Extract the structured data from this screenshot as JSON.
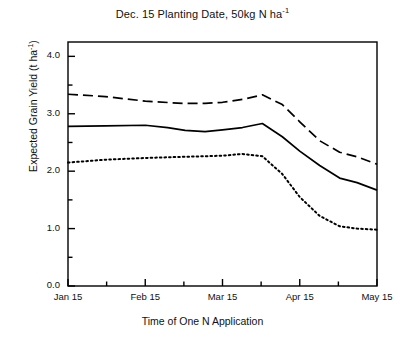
{
  "chart_data": {
    "type": "line",
    "title": "Dec. 15 Planting Date, 50kg N ha-1",
    "title_main": "Dec. 15 Planting Date, 50kg N ha",
    "title_sup": "-1",
    "xlabel": "Time of One N Application",
    "ylabel_main": "Expected Grain Yield (t ha",
    "ylabel_sup": "-1",
    "ylabel_tail": ")",
    "ylabel": "Expected Grain Yield (t ha-1)",
    "ylim": [
      0.0,
      4.25
    ],
    "ytick_labels": [
      "0.0",
      "1.0",
      "2.0",
      "3.0",
      "4.0"
    ],
    "ytick_values": [
      0.0,
      1.0,
      2.0,
      3.0,
      4.0
    ],
    "yminor_values": [
      0.5,
      1.5,
      2.5,
      3.5
    ],
    "xtick_labels": [
      "Jan 15",
      "Feb 15",
      "Mar 15",
      "Apr 15",
      "May 15"
    ],
    "xtick_values": [
      0,
      31,
      62,
      93,
      124
    ],
    "xminor_values": [
      15.5,
      46.5,
      77.5,
      108.5
    ],
    "xlim": [
      0,
      124
    ],
    "grid": false,
    "legend": "none",
    "series": [
      {
        "name": "dashed-series",
        "style": "dashed",
        "x": [
          0,
          15,
          31,
          46,
          55,
          62,
          70,
          78,
          86,
          93,
          101,
          109,
          116,
          124
        ],
        "values": [
          3.34,
          3.3,
          3.22,
          3.18,
          3.18,
          3.2,
          3.25,
          3.33,
          3.16,
          2.86,
          2.53,
          2.33,
          2.25,
          2.12
        ]
      },
      {
        "name": "solid-series",
        "style": "solid",
        "x": [
          0,
          15,
          31,
          40,
          47,
          55,
          62,
          70,
          78,
          86,
          93,
          101,
          109,
          116,
          124
        ],
        "values": [
          2.78,
          2.79,
          2.8,
          2.76,
          2.71,
          2.69,
          2.72,
          2.76,
          2.83,
          2.6,
          2.35,
          2.1,
          1.88,
          1.8,
          1.67
        ]
      },
      {
        "name": "dotted-series",
        "style": "dotted",
        "x": [
          0,
          15,
          31,
          46,
          55,
          62,
          70,
          78,
          86,
          93,
          101,
          109,
          116,
          124
        ],
        "values": [
          2.15,
          2.2,
          2.23,
          2.25,
          2.26,
          2.27,
          2.3,
          2.26,
          1.95,
          1.55,
          1.22,
          1.04,
          1.0,
          0.98
        ]
      }
    ]
  }
}
